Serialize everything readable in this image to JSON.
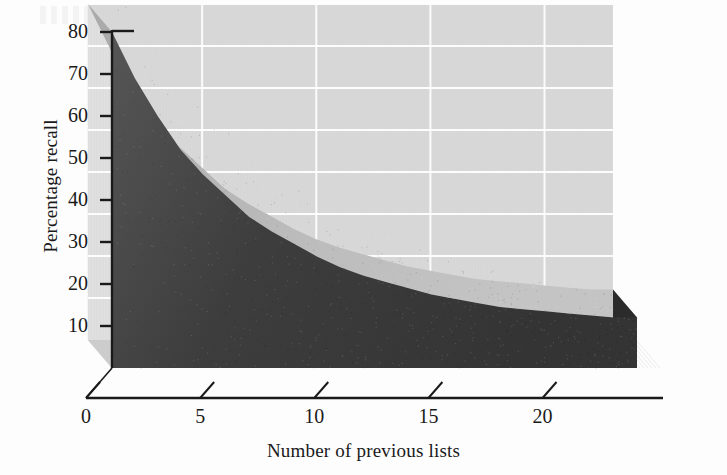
{
  "figure": {
    "background_color": "#fdfdfd",
    "plot_background_color": "#d8d8d8",
    "gridline_color": "#ffffff",
    "axis_color": "#1a1a1a",
    "front_face_color": "#3a3a3a",
    "top_surface_color": "#b4b4b4",
    "side_face_color": "#2b2b2b",
    "floor_color": "#cdcdcd"
  },
  "chart_data": {
    "type": "area",
    "title": "",
    "subtitle": "",
    "xlabel": "Number of previous lists",
    "ylabel": "Percentage recall",
    "xlim": [
      0,
      23
    ],
    "ylim": [
      0,
      90
    ],
    "xticks": [
      0,
      5,
      10,
      15,
      20
    ],
    "xtick_labels": [
      "0",
      "5",
      "10",
      "15",
      "20"
    ],
    "yticks": [
      10,
      20,
      30,
      40,
      50,
      60,
      70,
      80,
      90
    ],
    "ytick_labels": [
      "10",
      "20",
      "30",
      "40",
      "50",
      "60",
      "70",
      "80",
      "90"
    ],
    "grid": true,
    "grid_axis": "y",
    "legend": false,
    "legend_position": "none",
    "style": "3d-area",
    "annotations": [],
    "series": [
      {
        "name": "Percentage recall",
        "x": [
          0,
          1,
          2,
          3,
          4,
          5,
          6,
          7,
          8,
          9,
          10,
          11,
          12,
          13,
          14,
          15,
          16,
          17,
          18,
          19,
          20,
          21,
          22,
          23
        ],
        "values": [
          80,
          69,
          60,
          52,
          46,
          41,
          36,
          32.5,
          29.5,
          26.5,
          24,
          22,
          20.5,
          19,
          17.5,
          16.5,
          15.5,
          14.5,
          14,
          13.5,
          13,
          12.5,
          12,
          12
        ]
      }
    ]
  },
  "labels": {
    "y_axis_title": "Percentage recall",
    "x_axis_title": "Number of previous lists"
  }
}
